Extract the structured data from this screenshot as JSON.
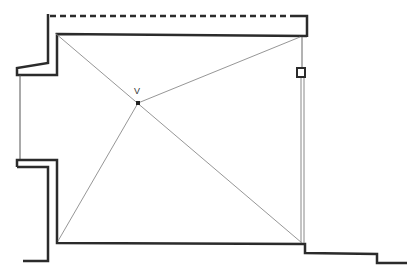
{
  "diagram": {
    "type": "architectural-floor-plan-section",
    "background": "#ffffff",
    "stroke_color": "#2b2b2b",
    "thin_stroke_color": "#8a8a8a",
    "point_label": "V",
    "elements": {
      "dashed_top_edge": "dashed overhead line",
      "room_rectangle": "rectangular room with diagonals",
      "vanishing_point": "V",
      "right_marker": "small square marker on right wall",
      "bottom_step": "stepped floor line at bottom right"
    }
  }
}
